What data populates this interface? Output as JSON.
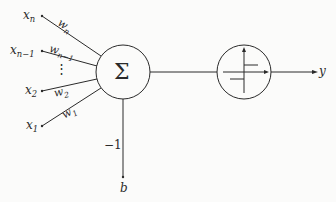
{
  "diagram": {
    "inputs": [
      {
        "name": "x",
        "sub": "n",
        "weight": "w",
        "weight_sub": "n"
      },
      {
        "name": "x",
        "sub": "n−1",
        "weight": "w",
        "weight_sub": "n−1"
      },
      {
        "name": "x",
        "sub": "2",
        "weight": "w",
        "weight_sub": "2"
      },
      {
        "name": "x",
        "sub": "1",
        "weight": "w",
        "weight_sub": "1"
      }
    ],
    "ellipsis": "⋮",
    "summation_symbol": "Σ",
    "activation": "step-function",
    "bias_weight": "−1",
    "bias_label": "b",
    "output_label": "y",
    "colors": {
      "line": "#2a2a2a",
      "background": "#fbfbfa"
    }
  }
}
